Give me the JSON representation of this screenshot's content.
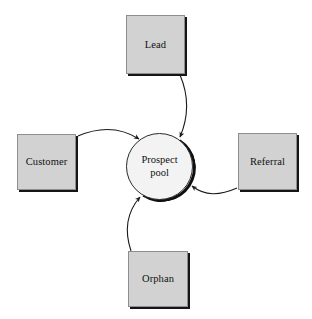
{
  "diagram": {
    "type": "hub-and-spoke",
    "background_color": "#ffffff",
    "node_fill_color": "#d2d2d2",
    "node_border_color": "#8e8e8e",
    "node_shadow_color": "#151515",
    "hub_fill_color": "#f3f3f3",
    "hub_border_color": "#2a2a2a",
    "edge_color": "#1a1a1a",
    "hub": {
      "label_line_1": "Prospect",
      "label_line_2": "pool",
      "shape": "circle",
      "center_x": 159,
      "center_y": 166,
      "diameter": 67
    },
    "nodes": [
      {
        "id": "lead",
        "label": "Lead",
        "shape": "rectangle",
        "x": 126,
        "y": 15,
        "width": 59,
        "height": 59,
        "position": "top"
      },
      {
        "id": "customer",
        "label": "Customer",
        "shape": "rectangle",
        "x": 17,
        "y": 134,
        "width": 59,
        "height": 56,
        "position": "left"
      },
      {
        "id": "referral",
        "label": "Referral",
        "shape": "rectangle",
        "x": 238,
        "y": 133,
        "width": 59,
        "height": 57,
        "position": "right"
      },
      {
        "id": "orphan",
        "label": "Orphan",
        "shape": "rectangle",
        "x": 128,
        "y": 251,
        "width": 60,
        "height": 56,
        "position": "bottom"
      }
    ],
    "edges": [
      {
        "id": "lead-to-pool",
        "from": "lead",
        "to": "hub",
        "style": "curved-arrow",
        "arrowhead": "at-hub",
        "direction": "into-hub"
      },
      {
        "id": "customer-to-pool",
        "from": "customer",
        "to": "hub",
        "style": "curved-arrow",
        "arrowhead": "at-hub",
        "direction": "into-hub"
      },
      {
        "id": "referral-to-pool",
        "from": "referral",
        "to": "hub",
        "style": "curved-arrow",
        "arrowhead": "at-hub",
        "direction": "into-hub"
      },
      {
        "id": "orphan-to-pool",
        "from": "orphan",
        "to": "hub",
        "style": "curved-arrow",
        "arrowhead": "at-hub",
        "direction": "into-hub"
      }
    ]
  }
}
